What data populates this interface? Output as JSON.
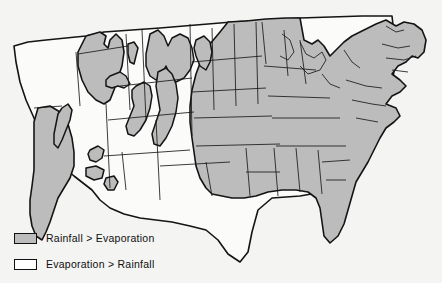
{
  "figure": {
    "type": "thematic-choropleth-map",
    "region": "Contiguous United States"
  },
  "legend": {
    "items": [
      {
        "key": "wet",
        "label": "Rainfall  >  Evaporation",
        "color": "#bcbcbc",
        "swatch": "gray-filled-rectangle"
      },
      {
        "key": "dry",
        "label": "Evaporation  >  Rainfall",
        "color": "#ffffff",
        "swatch": "white-filled-rectangle"
      }
    ]
  },
  "colors": {
    "wet_fill": "#bcbcbc",
    "dry_fill": "#fbfbfa",
    "outline": "#0d0d0d",
    "background": "#f4f4f2"
  },
  "map_regions": {
    "wet_description": "Eastern United States from the Great Lakes and eastern Plains to the Atlantic and Gulf coasts, plus the Pacific Northwest coast and isolated western mountain ranges",
    "dry_description": "Interior West and Great Plains west of the rainfall/evaporation divide",
    "mountain_patches": [
      "Olympic-Cascade Range",
      "Northern Rockies (Idaho-Montana)",
      "Bitterroot Range",
      "Wasatch Range",
      "Colorado Rockies",
      "Uinta Range",
      "Sierra Nevada",
      "Arizona highlands",
      "Mogollon Rim"
    ]
  }
}
